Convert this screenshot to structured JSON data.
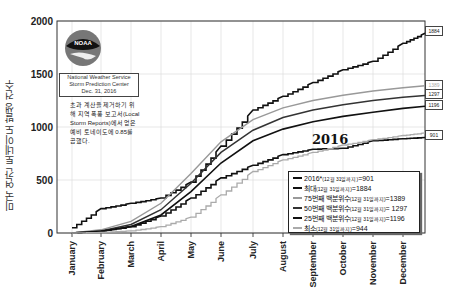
{
  "chart_data": {
    "type": "line",
    "title": "",
    "ylabel": "미국 연간 토네이도 발생 건수",
    "xlabel": "",
    "ylim": [
      0,
      2000
    ],
    "yticks": [
      0,
      500,
      1000,
      1500,
      2000
    ],
    "x_tick_labels": [
      "January",
      "February",
      "March",
      "April",
      "May",
      "June",
      "July",
      "August",
      "September",
      "October",
      "November",
      "December"
    ],
    "grid": true,
    "legend_position": "lower right",
    "annotation": "2016",
    "source_box": [
      "National Weather Service",
      "Storm Prediction Center",
      "Dec. 31, 2016"
    ],
    "note": "초과 계산을 제거하기 위해 지역 폭풍 보고서(Local Storm Reports)에서 얻은 예비 토네이도에 0.85를 곱했다.",
    "x": [
      "Jan",
      "Feb",
      "Mar",
      "Apr",
      "May",
      "Jun",
      "Jul",
      "Aug",
      "Sep",
      "Oct",
      "Nov",
      "Dec",
      "Dec31"
    ],
    "series": [
      {
        "name": "2016*",
        "legend_main": "2016*",
        "legend_small": "(12월 31일까지)",
        "legend_value": "=901",
        "end_value": 901,
        "color": "#111111",
        "width": 1.6,
        "values": [
          0,
          20,
          60,
          160,
          330,
          520,
          640,
          740,
          790,
          800,
          870,
          890,
          901
        ]
      },
      {
        "name": "최대",
        "legend_main": "최대",
        "legend_small": "(12월 31일까지)",
        "legend_value": "=1884",
        "end_value": 1884,
        "color": "#111111",
        "width": 1.6,
        "values": [
          50,
          230,
          280,
          330,
          480,
          820,
          1160,
          1290,
          1420,
          1540,
          1620,
          1790,
          1884
        ]
      },
      {
        "name": "75번째 백분위수",
        "legend_main": "75번째 백분위수",
        "legend_small": "(12월 31일까지)",
        "legend_value": "=1389",
        "end_value": 1389,
        "color": "#999999",
        "width": 1.4,
        "values": [
          0,
          30,
          110,
          280,
          560,
          860,
          1070,
          1180,
          1250,
          1300,
          1340,
          1370,
          1389
        ]
      },
      {
        "name": "50번째 백분위수",
        "legend_main": "50번째 백분위수",
        "legend_small": "(12월 31일까지)",
        "legend_value": "= 1297",
        "end_value": 1297,
        "color": "#333333",
        "width": 1.5,
        "values": [
          0,
          20,
          80,
          220,
          470,
          760,
          970,
          1090,
          1160,
          1210,
          1250,
          1280,
          1297
        ]
      },
      {
        "name": "25번째 백분위수",
        "legend_main": "25번째 백분위수",
        "legend_small": "(12월 31일까지)",
        "legend_value": "=1196",
        "end_value": 1196,
        "color": "#111111",
        "width": 1.6,
        "values": [
          0,
          15,
          60,
          170,
          390,
          660,
          870,
          980,
          1050,
          1100,
          1140,
          1175,
          1196
        ]
      },
      {
        "name": "최소",
        "legend_main": "최소",
        "legend_small": "(12월 31일까지)",
        "legend_value": "=944",
        "end_value": 944,
        "color": "#aaaaaa",
        "width": 1.3,
        "values": [
          0,
          5,
          20,
          60,
          150,
          360,
          580,
          690,
          760,
          830,
          880,
          920,
          944
        ]
      }
    ],
    "end_labels": [
      "1884",
      "1389",
      "1297",
      "1196",
      "901"
    ]
  }
}
